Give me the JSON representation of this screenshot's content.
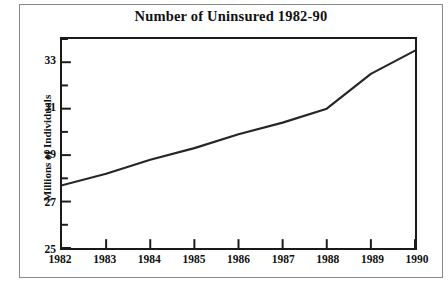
{
  "chart_data": {
    "type": "line",
    "title": "Number of Uninsured 1982-90",
    "xlabel": "",
    "ylabel": "Millions of Individuals",
    "categories": [
      "1982",
      "1983",
      "1984",
      "1985",
      "1986",
      "1987",
      "1988",
      "1989",
      "1990"
    ],
    "x": [
      1982,
      1983,
      1984,
      1985,
      1986,
      1987,
      1988,
      1989,
      1990
    ],
    "values": [
      27.7,
      28.2,
      28.8,
      29.3,
      29.9,
      30.4,
      31.0,
      32.5,
      33.5
    ],
    "series": [
      {
        "name": "Number of Uninsured",
        "values": [
          27.7,
          28.2,
          28.8,
          29.3,
          29.9,
          30.4,
          31.0,
          32.5,
          33.5
        ]
      }
    ],
    "ylim": [
      25,
      34
    ],
    "xlim": [
      1982,
      1990
    ],
    "y_major_ticks": [
      25,
      27,
      29,
      31,
      33
    ],
    "y_major_tick_labels": [
      "25",
      "27",
      "29",
      "31",
      "33"
    ],
    "y_minor_ticks": [
      26,
      28,
      30,
      32,
      34
    ],
    "x_ticks": [
      1982,
      1983,
      1984,
      1985,
      1986,
      1987,
      1988,
      1989,
      1990
    ],
    "grid": false,
    "legend": "none",
    "line_color": "#262626",
    "frame_color": "#1a1a1a",
    "background_color": "#ffffff"
  }
}
